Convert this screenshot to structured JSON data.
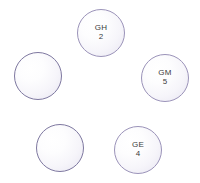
{
  "canvas": {
    "width": 200,
    "height": 183,
    "background": "#ffffff"
  },
  "style": {
    "node_border_color": "#9b93b9",
    "node_border_color_empty": "#7e78a0",
    "node_fill_light": "#ffffff",
    "node_fill_shade": "#e6e3f0",
    "text_color": "#3b3b3b"
  },
  "diagram": {
    "type": "node-bubble-layout",
    "nodes": [
      {
        "id": "node-gh",
        "code": "GH",
        "value": "2",
        "labeled": true,
        "x": 77,
        "y": 9,
        "diameter": 48
      },
      {
        "id": "node-left-blank",
        "code": "",
        "value": "",
        "labeled": false,
        "x": 14,
        "y": 52,
        "diameter": 48
      },
      {
        "id": "node-gm",
        "code": "GM",
        "value": "5",
        "labeled": true,
        "x": 141,
        "y": 54,
        "diameter": 48
      },
      {
        "id": "node-bottomleft-blank",
        "code": "",
        "value": "",
        "labeled": false,
        "x": 36,
        "y": 124,
        "diameter": 48
      },
      {
        "id": "node-ge",
        "code": "GE",
        "value": "4",
        "labeled": true,
        "x": 114,
        "y": 126,
        "diameter": 48
      }
    ]
  }
}
